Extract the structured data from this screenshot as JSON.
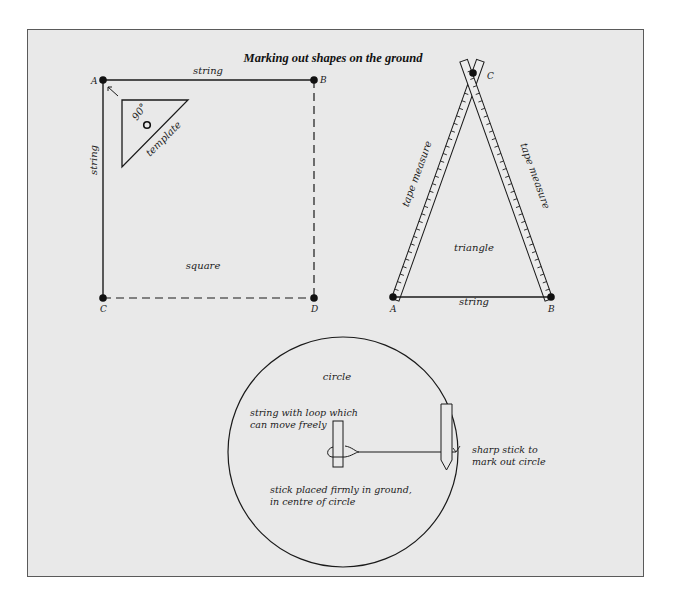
{
  "title": "Marking out shapes on the ground",
  "square": {
    "label": "square",
    "top_string_label": "string",
    "left_string_label": "string",
    "points": {
      "A": "A",
      "B": "B",
      "C": "C",
      "D": "D"
    },
    "template": {
      "angle_label": "90°",
      "label": "template"
    }
  },
  "triangle": {
    "label": "triangle",
    "left_tape_label": "tape measure",
    "right_tape_label": "tape measure",
    "base_string_label": "string",
    "points": {
      "A": "A",
      "B": "B",
      "C": "C"
    }
  },
  "circle": {
    "label": "circle",
    "loop_note_line1": "string with loop which",
    "loop_note_line2": "can move freely",
    "center_note_line1": "stick placed firmly in ground,",
    "center_note_line2": "in centre of circle",
    "sharp_note_line1": "sharp stick to",
    "sharp_note_line2": "mark out circle"
  },
  "colors": {
    "background": "#e9e9e9",
    "ink": "#1a1a1a",
    "border": "#5a5a5a"
  }
}
